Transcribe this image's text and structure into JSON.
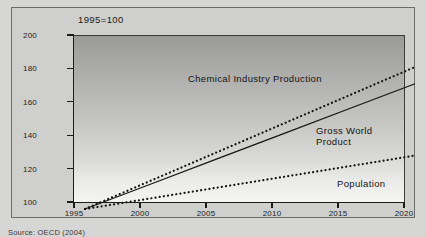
{
  "figure": {
    "title": "1995=100",
    "source": "Source: OECD (2004)"
  },
  "chart_data": {
    "type": "line",
    "title": "1995=100",
    "xlabel": "",
    "ylabel": "",
    "xlim": [
      1995,
      2020
    ],
    "ylim": [
      100,
      200
    ],
    "grid": false,
    "legend_position": "inline-annotations",
    "x": [
      1995,
      2000,
      2005,
      2010,
      2015,
      2020
    ],
    "xticklabels": [
      "1995",
      "2000",
      "2005",
      "2010",
      "2015",
      "2020"
    ],
    "yticks": [
      100,
      120,
      140,
      160,
      180,
      200
    ],
    "yticklabels": [
      "100",
      "120",
      "140",
      "160",
      "180",
      "200"
    ],
    "series": [
      {
        "name": "Chemical Industry Production",
        "style": "dotted",
        "color": "#141414",
        "values": [
          100,
          117,
          134,
          151,
          168,
          185
        ]
      },
      {
        "name": "Gross World Product",
        "style": "solid",
        "color": "#141414",
        "values": [
          100,
          115,
          130,
          145,
          160,
          175
        ]
      },
      {
        "name": "Population",
        "style": "dotted",
        "color": "#141414",
        "values": [
          100,
          106.4,
          112.8,
          119.2,
          125.6,
          132
        ]
      }
    ],
    "annotations": [
      {
        "text": "Chemical Industry Production",
        "series": "Chemical Industry Production"
      },
      {
        "text": "Gross World\nProduct",
        "series": "Gross World Product"
      },
      {
        "text": "Population",
        "series": "Population"
      }
    ]
  },
  "labels": {
    "chemical": "Chemical Industry Production",
    "gross_world_product": "Gross World\nProduct",
    "population": "Population"
  }
}
